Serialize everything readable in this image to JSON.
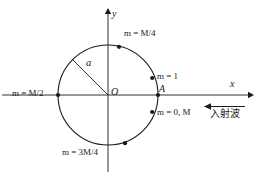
{
  "figure": {
    "type": "geometry-diagram",
    "axes": {
      "x_label": "x",
      "y_label": "y",
      "origin_label": "O"
    },
    "circle": {
      "radius_label": "a"
    },
    "point_labels": [
      {
        "id": "m-quarter",
        "text": "m = M/4"
      },
      {
        "id": "m-half",
        "text": "m = M/2"
      },
      {
        "id": "m-one",
        "text": "m = 1"
      },
      {
        "id": "point-a",
        "text": "A"
      },
      {
        "id": "m-zero-m",
        "text": "m = 0, M"
      },
      {
        "id": "m-three-quarter",
        "text": "m = 3M/4"
      }
    ],
    "annotation": {
      "incident_wave_text": "入射波",
      "arrow_direction": "left"
    },
    "colors": {
      "stroke": "#1a1a1a",
      "background": "#ffffff"
    }
  }
}
